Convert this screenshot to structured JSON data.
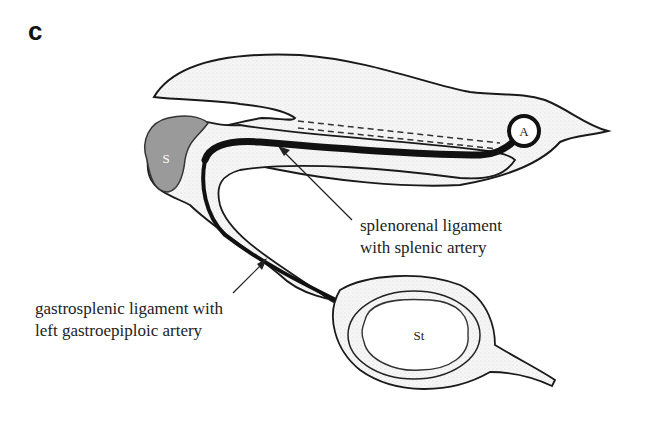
{
  "panel": {
    "letter": "c"
  },
  "organs": {
    "spleen": {
      "abbr": "S",
      "fill": "#9a9a9a"
    },
    "kidney": {
      "abbr": "A"
    },
    "stomach": {
      "abbr": "St"
    }
  },
  "labels": {
    "splenorenal": {
      "line1": "splenorenal ligament",
      "line2": "with splenic artery"
    },
    "gastrosplenic": {
      "line1": "gastrosplenic ligament with",
      "line2": "left gastroepiploic artery"
    }
  },
  "colors": {
    "outline": "#1a1a1a",
    "stipple": "#f2f2f2",
    "spleen": "#9a9a9a",
    "artery": "#111111"
  }
}
